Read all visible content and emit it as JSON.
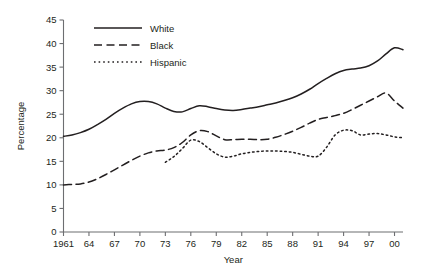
{
  "chart_data": {
    "type": "line",
    "title": "",
    "xlabel": "Year",
    "ylabel": "Percentage",
    "ylim": [
      0,
      45
    ],
    "ytick_step": 5,
    "yticks": [
      0,
      5,
      10,
      15,
      20,
      25,
      30,
      35,
      40,
      45
    ],
    "xlim": [
      1961,
      2001
    ],
    "xticks": [
      1961,
      1964,
      1967,
      1970,
      1973,
      1976,
      1979,
      1982,
      1985,
      1988,
      1991,
      1994,
      1997,
      2000
    ],
    "xtick_labels": [
      "1961",
      "64",
      "67",
      "70",
      "73",
      "76",
      "79",
      "82",
      "85",
      "88",
      "91",
      "94",
      "97",
      "00"
    ],
    "grid": false,
    "legend_position": "top-left-inside",
    "line_color": "#231f20",
    "axis_color": "#6d6e71",
    "series": [
      {
        "name": "White",
        "style": "solid",
        "x": [
          1961,
          1962,
          1963,
          1964,
          1965,
          1966,
          1967,
          1968,
          1969,
          1970,
          1971,
          1972,
          1973,
          1974,
          1975,
          1976,
          1977,
          1978,
          1979,
          1980,
          1981,
          1982,
          1983,
          1984,
          1985,
          1986,
          1987,
          1988,
          1989,
          1990,
          1991,
          1992,
          1993,
          1994,
          1995,
          1996,
          1997,
          1998,
          1999,
          2000,
          2001
        ],
        "values": [
          20.3,
          20.6,
          21.1,
          21.8,
          22.8,
          23.9,
          25.2,
          26.3,
          27.2,
          27.7,
          27.7,
          27.2,
          26.3,
          25.6,
          25.5,
          26.2,
          26.8,
          26.6,
          26.2,
          25.9,
          25.8,
          26.0,
          26.3,
          26.6,
          27.0,
          27.4,
          27.9,
          28.5,
          29.3,
          30.3,
          31.5,
          32.6,
          33.6,
          34.3,
          34.6,
          34.8,
          35.3,
          36.3,
          37.8,
          39.1,
          38.7
        ]
      },
      {
        "name": "Black",
        "style": "dashed",
        "x": [
          1961,
          1962,
          1963,
          1964,
          1965,
          1966,
          1967,
          1968,
          1969,
          1970,
          1971,
          1972,
          1973,
          1974,
          1975,
          1976,
          1977,
          1978,
          1979,
          1980,
          1981,
          1982,
          1983,
          1984,
          1985,
          1986,
          1987,
          1988,
          1989,
          1990,
          1991,
          1992,
          1993,
          1994,
          1995,
          1996,
          1997,
          1998,
          1999,
          2000,
          2001
        ],
        "values": [
          10.0,
          10.1,
          10.2,
          10.6,
          11.3,
          12.2,
          13.2,
          14.2,
          15.2,
          16.1,
          16.8,
          17.2,
          17.4,
          17.9,
          19.0,
          20.6,
          21.5,
          21.3,
          20.4,
          19.6,
          19.6,
          19.7,
          19.7,
          19.6,
          19.7,
          20.1,
          20.7,
          21.4,
          22.2,
          23.1,
          23.9,
          24.3,
          24.7,
          25.2,
          26.0,
          26.9,
          27.8,
          28.7,
          29.5,
          27.8,
          26.3
        ]
      },
      {
        "name": "Hispanic",
        "style": "dotted",
        "x": [
          1973,
          1974,
          1975,
          1976,
          1977,
          1978,
          1979,
          1980,
          1981,
          1982,
          1983,
          1984,
          1985,
          1986,
          1987,
          1988,
          1989,
          1990,
          1991,
          1992,
          1993,
          1994,
          1995,
          1996,
          1997,
          1998,
          1999,
          2000,
          2001
        ],
        "values": [
          14.8,
          16.0,
          17.7,
          19.5,
          19.2,
          17.9,
          16.6,
          15.9,
          16.1,
          16.6,
          16.9,
          17.1,
          17.2,
          17.2,
          17.1,
          16.9,
          16.5,
          16.1,
          16.1,
          18.0,
          20.6,
          21.6,
          21.5,
          20.6,
          20.8,
          20.9,
          20.6,
          20.2,
          20.0
        ]
      }
    ]
  },
  "legend": {
    "items": [
      {
        "label": "White",
        "style": "solid"
      },
      {
        "label": "Black",
        "style": "dashed"
      },
      {
        "label": "Hispanic",
        "style": "dotted"
      }
    ]
  }
}
